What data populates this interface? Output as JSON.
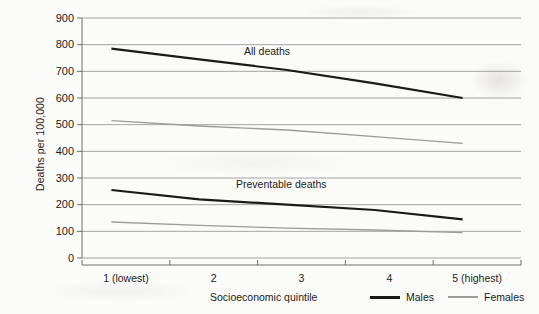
{
  "chart_data": {
    "type": "line",
    "title": "",
    "xlabel": "Socioeconomic quintile",
    "ylabel": "Deaths per 100,000",
    "categories": [
      "1 (lowest)",
      "2",
      "3",
      "4",
      "5 (highest)"
    ],
    "ylim": [
      0,
      900
    ],
    "yticks": [
      0,
      100,
      200,
      300,
      400,
      500,
      600,
      700,
      800,
      900
    ],
    "grid": "horizontal",
    "legend_position": "bottom-right",
    "series": [
      {
        "name": "Males",
        "group": "All deaths",
        "values": [
          785,
          745,
          705,
          655,
          600
        ]
      },
      {
        "name": "Females",
        "group": "All deaths",
        "values": [
          515,
          495,
          480,
          455,
          430
        ]
      },
      {
        "name": "Males",
        "group": "Preventable deaths",
        "values": [
          255,
          220,
          200,
          180,
          145
        ]
      },
      {
        "name": "Females",
        "group": "Preventable deaths",
        "values": [
          135,
          122,
          112,
          105,
          95
        ]
      }
    ],
    "annotations": [
      {
        "text": "All deaths",
        "x": 3.0,
        "y": 830
      },
      {
        "text": "Preventable deaths",
        "x": 2.9,
        "y": 300
      }
    ],
    "colors": {
      "males": "#1a1a1a",
      "females": "#9b9b9b",
      "grid": "#8f8f8f",
      "axis": "#6e6e6e",
      "background": "#fbfbf9"
    }
  },
  "axes": {
    "y_tick_labels": [
      "900",
      "800",
      "700",
      "600",
      "500",
      "400",
      "300",
      "200",
      "100",
      "0"
    ],
    "y_axis_title": "Deaths per 100,000",
    "x_tick_labels": [
      "1 (lowest)",
      "2",
      "3",
      "4",
      "5 (highest)"
    ],
    "x_axis_title": "Socioeconomic quintile"
  },
  "annotations": {
    "all_deaths": "All deaths",
    "preventable_deaths": "Preventable deaths"
  },
  "legend": {
    "axis_title": "Socioeconomic quintile",
    "items": [
      {
        "label": "Males"
      },
      {
        "label": "Females"
      }
    ]
  }
}
